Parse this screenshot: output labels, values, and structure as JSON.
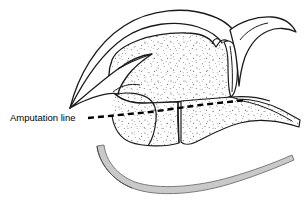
{
  "figure": {
    "type": "medical-line-illustration",
    "canvas": {
      "width": 308,
      "height": 210,
      "background": "#ffffff"
    },
    "annotations": [
      {
        "id": "amputation-line-label",
        "text": "Amputation line",
        "x": 10,
        "y": 121,
        "font_size": 9.5,
        "color": "#000000"
      }
    ],
    "leader": {
      "id": "amputation-line",
      "style": "dashed",
      "color": "#000000",
      "width": 2.4,
      "dash": "6,4",
      "points": "88,118 150,112 200,105 247,100"
    },
    "colors": {
      "outline": "#1a1a1a",
      "stipple": "#2b2b2b",
      "soft_tissue_band": "#c9c9c9",
      "soft_tissue_band_edge": "#8a8a8a",
      "background": "#ffffff"
    },
    "structures": [
      {
        "id": "outer-arch",
        "label": "outer cortical arch"
      },
      {
        "id": "inner-arch",
        "label": "inner cortical arch"
      },
      {
        "id": "hook-process",
        "label": "hook-shaped process"
      },
      {
        "id": "stippled-body",
        "label": "cancellous bone body"
      },
      {
        "id": "right-sliver",
        "label": "thin lateral sliver"
      },
      {
        "id": "right-limb",
        "label": "tapering lateral limb"
      },
      {
        "id": "soft-tissue-band",
        "label": "curved soft tissue band"
      }
    ]
  }
}
